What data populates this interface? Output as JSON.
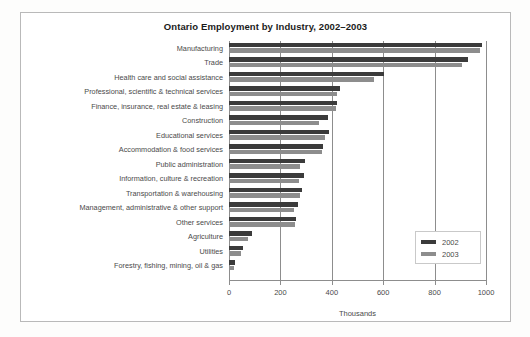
{
  "frame": {
    "border_color": "#b9b9b9"
  },
  "chart_data": {
    "type": "bar",
    "orientation": "horizontal",
    "title": "Ontario Employment by Industry, 2002–2003",
    "xlabel": "Thousands",
    "ylabel": "",
    "xlim": [
      0,
      1000
    ],
    "xticks": [
      0,
      200,
      400,
      600,
      800,
      1000
    ],
    "xtick_labels": [
      "0",
      "200",
      "400",
      "600",
      "800",
      "1000"
    ],
    "grid": true,
    "legend_position": "right-inside",
    "colors": {
      "2002": "#3b3b3b",
      "2003": "#8d8d8d"
    },
    "categories": [
      "Manufacturing",
      "Trade",
      "Health care and social assistance",
      "Professional, scientific & technical services",
      "Finance, insurance, real estate & leasing",
      "Construction",
      "Educational services",
      "Accommodation & food services",
      "Public administration",
      "Information, culture & recreation",
      "Transportation & warehousing",
      "Management, administrative & other support",
      "Other services",
      "Agriculture",
      "Utilities",
      "Forestry, fishing, mining, oil & gas"
    ],
    "series": [
      {
        "name": "2002",
        "values": [
          985,
          930,
          605,
          430,
          420,
          385,
          390,
          365,
          295,
          290,
          285,
          268,
          262,
          90,
          55,
          24
        ]
      },
      {
        "name": "2003",
        "values": [
          975,
          905,
          565,
          420,
          415,
          350,
          375,
          362,
          278,
          272,
          278,
          252,
          258,
          74,
          46,
          21
        ]
      }
    ]
  },
  "legend": {
    "items": [
      {
        "label": "2002",
        "color": "#3b3b3b"
      },
      {
        "label": "2003",
        "color": "#8d8d8d"
      }
    ]
  }
}
